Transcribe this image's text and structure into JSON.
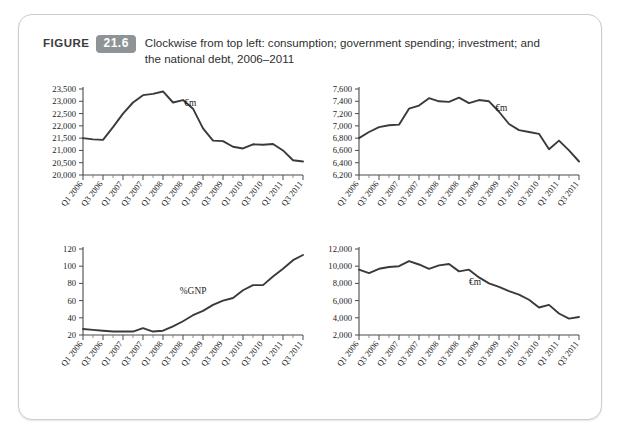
{
  "figure": {
    "label": "FIGURE",
    "number": "21.6",
    "caption": "Clockwise from top left: consumption; government spending; investment; and the national debt, 2006–2011"
  },
  "style": {
    "line_color": "#3a3a3a",
    "axis_color": "#4a4a4a",
    "badge_color": "#8e9396",
    "panel_border": "#c9cdd2"
  },
  "x_categories": [
    "Q1 2006",
    "Q3 2006",
    "Q1 2007",
    "Q3 2007",
    "Q1 2008",
    "Q3 2008",
    "Q1 2009",
    "Q3 2009",
    "Q1 2010",
    "Q3 2010",
    "Q1 2011",
    "Q3 2011"
  ],
  "chart_data": [
    {
      "type": "line",
      "id": "consumption",
      "position": "top-left",
      "title": "",
      "annotation": "€m",
      "xlabel": "",
      "ylabel": "",
      "ylim": [
        20000,
        23500
      ],
      "yticks": [
        20000,
        20500,
        21000,
        21500,
        22000,
        22500,
        23000,
        23500
      ],
      "ytick_labels": [
        "20,000",
        "20,500",
        "21,000",
        "21,500",
        "22,000",
        "22,500",
        "23,000",
        "23,500"
      ],
      "grid": false,
      "x": [
        "Q1 2006",
        "Q2 2006",
        "Q3 2006",
        "Q4 2006",
        "Q1 2007",
        "Q2 2007",
        "Q3 2007",
        "Q4 2007",
        "Q1 2008",
        "Q2 2008",
        "Q3 2008",
        "Q4 2008",
        "Q1 2009",
        "Q2 2009",
        "Q3 2009",
        "Q4 2009",
        "Q1 2010",
        "Q2 2010",
        "Q3 2010",
        "Q4 2010",
        "Q1 2011",
        "Q2 2011",
        "Q3 2011"
      ],
      "values": [
        21500,
        21450,
        21430,
        21950,
        22500,
        22950,
        23250,
        23300,
        23400,
        22950,
        23050,
        22700,
        21900,
        21400,
        21380,
        21150,
        21080,
        21250,
        21230,
        21260,
        21000,
        20600,
        20550
      ]
    },
    {
      "type": "line",
      "id": "government-spending",
      "position": "top-right",
      "title": "",
      "annotation": "€m",
      "xlabel": "",
      "ylabel": "",
      "ylim": [
        6200,
        7600
      ],
      "yticks": [
        6200,
        6400,
        6600,
        6800,
        7000,
        7200,
        7400,
        7600
      ],
      "ytick_labels": [
        "6,200",
        "6,400",
        "6,600",
        "6,800",
        "7,000",
        "7,200",
        "7,400",
        "7,600"
      ],
      "grid": false,
      "x": [
        "Q1 2006",
        "Q2 2006",
        "Q3 2006",
        "Q4 2006",
        "Q1 2007",
        "Q2 2007",
        "Q3 2007",
        "Q4 2007",
        "Q1 2008",
        "Q2 2008",
        "Q3 2008",
        "Q4 2008",
        "Q1 2009",
        "Q2 2009",
        "Q3 2009",
        "Q4 2009",
        "Q1 2010",
        "Q2 2010",
        "Q3 2010",
        "Q4 2010",
        "Q1 2011",
        "Q2 2011",
        "Q3 2011"
      ],
      "values": [
        6800,
        6900,
        6980,
        7010,
        7020,
        7280,
        7330,
        7450,
        7400,
        7390,
        7460,
        7370,
        7420,
        7400,
        7230,
        7030,
        6930,
        6900,
        6870,
        6620,
        6760,
        6600,
        6420
      ]
    },
    {
      "type": "line",
      "id": "national-debt",
      "position": "bottom-left",
      "title": "",
      "annotation": "%GNP",
      "xlabel": "",
      "ylabel": "",
      "ylim": [
        20,
        120
      ],
      "yticks": [
        20,
        40,
        60,
        80,
        100,
        120
      ],
      "ytick_labels": [
        "20",
        "40",
        "60",
        "80",
        "100",
        "120"
      ],
      "grid": false,
      "x": [
        "Q1 2006",
        "Q2 2006",
        "Q3 2006",
        "Q4 2006",
        "Q1 2007",
        "Q2 2007",
        "Q3 2007",
        "Q4 2007",
        "Q1 2008",
        "Q2 2008",
        "Q3 2008",
        "Q4 2008",
        "Q1 2009",
        "Q2 2009",
        "Q3 2009",
        "Q4 2009",
        "Q1 2010",
        "Q2 2010",
        "Q3 2010",
        "Q4 2010",
        "Q1 2011",
        "Q2 2011",
        "Q3 2011"
      ],
      "values": [
        27,
        26,
        25,
        24,
        24,
        24,
        28,
        24,
        25,
        30,
        36,
        43,
        48,
        55,
        60,
        63,
        72,
        78,
        78,
        88,
        97,
        107,
        113
      ]
    },
    {
      "type": "line",
      "id": "investment",
      "position": "bottom-right",
      "title": "",
      "annotation": "€m",
      "xlabel": "",
      "ylabel": "",
      "ylim": [
        2000,
        12000
      ],
      "yticks": [
        2000,
        4000,
        6000,
        8000,
        10000,
        12000
      ],
      "ytick_labels": [
        "2,000",
        "4,000",
        "6,000",
        "8,000",
        "10,000",
        "12,000"
      ],
      "grid": false,
      "x": [
        "Q1 2006",
        "Q2 2006",
        "Q3 2006",
        "Q4 2006",
        "Q1 2007",
        "Q2 2007",
        "Q3 2007",
        "Q4 2007",
        "Q1 2008",
        "Q2 2008",
        "Q3 2008",
        "Q4 2008",
        "Q1 2009",
        "Q2 2009",
        "Q3 2009",
        "Q4 2009",
        "Q1 2010",
        "Q2 2010",
        "Q3 2010",
        "Q4 2010",
        "Q1 2011",
        "Q2 2011",
        "Q3 2011"
      ],
      "values": [
        9600,
        9200,
        9700,
        9900,
        10000,
        10600,
        10200,
        9700,
        10100,
        10250,
        9400,
        9600,
        8700,
        8000,
        7600,
        7100,
        6700,
        6100,
        5200,
        5500,
        4500,
        3900,
        4100
      ]
    }
  ]
}
